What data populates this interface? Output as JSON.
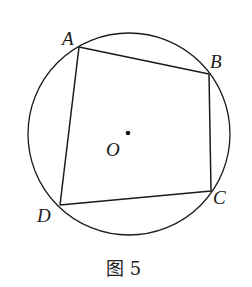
{
  "figure": {
    "caption": "图 5",
    "circle": {
      "center_label": "O",
      "cx": 129,
      "cy": 134,
      "r": 101
    },
    "points": {
      "A": {
        "label": "A",
        "x": 79,
        "y": 47
      },
      "B": {
        "label": "B",
        "x": 209,
        "y": 74
      },
      "C": {
        "label": "C",
        "x": 211,
        "y": 191
      },
      "D": {
        "label": "D",
        "x": 60,
        "y": 205
      }
    },
    "center_dot": {
      "x": 128,
      "y": 133
    },
    "quadrilateral": "ABCD",
    "colors": {
      "stroke": "#1a1a1a",
      "background": "#ffffff"
    }
  }
}
